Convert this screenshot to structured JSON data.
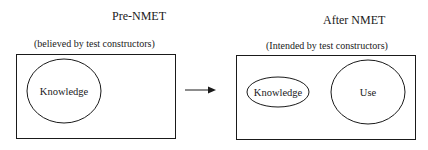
{
  "left_panel": {
    "title": "Pre-NMET",
    "subtitle": "(believed by test constructors)",
    "ellipses": [
      {
        "label": "Knowledge"
      }
    ]
  },
  "arrow": {
    "direction": "right"
  },
  "right_panel": {
    "title": "After NMET",
    "subtitle": "(Intended by test constructors)",
    "ellipses": [
      {
        "label": "Knowledge"
      },
      {
        "label": "Use"
      }
    ]
  },
  "colors": {
    "stroke": "#1a1a1a",
    "background": "#ffffff"
  }
}
